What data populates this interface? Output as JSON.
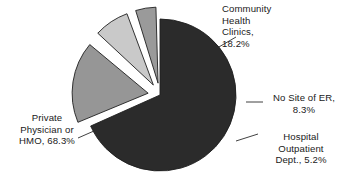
{
  "chart_data": {
    "type": "pie",
    "title": "",
    "xlabel": "",
    "ylabel": "",
    "legend_position": "none",
    "grid": false,
    "start_angle_deg": 0,
    "direction": "clockwise",
    "units": "percent",
    "total": 100.0,
    "categories": [
      "Private Physician or HMO",
      "Community Health Clinics",
      "No Site of ER",
      "Hospital Outpatient Dept."
    ],
    "values": [
      68.3,
      18.2,
      8.3,
      5.2
    ],
    "colors": [
      "#2b2b2b",
      "#969696",
      "#c9c9c9",
      "#9a9a9a"
    ],
    "exploded": [
      false,
      true,
      true,
      true
    ],
    "slices": [
      {
        "name": "Private Physician or HMO",
        "value": 68.3,
        "value_text": "68.3%",
        "label_lines": [
          "Private",
          "Physician or",
          "HMO, 68.3%"
        ],
        "color": "#2b2b2b",
        "exploded": false,
        "angle_deg": 245.9
      },
      {
        "name": "Community Health Clinics",
        "value": 18.2,
        "value_text": "18.2%",
        "label_lines": [
          "Community",
          "Health",
          "Clinics,",
          "18.2%"
        ],
        "color": "#969696",
        "exploded": true,
        "angle_deg": 65.5
      },
      {
        "name": "No Site of ER",
        "value": 8.3,
        "value_text": "8.3%",
        "label_lines": [
          "No Site of ER,",
          "8.3%"
        ],
        "color": "#c9c9c9",
        "exploded": true,
        "angle_deg": 29.9
      },
      {
        "name": "Hospital Outpatient Dept.",
        "value": 5.2,
        "value_text": "5.2%",
        "label_lines": [
          "Hospital",
          "Outpatient",
          "Dept., 5.2%"
        ],
        "color": "#9a9a9a",
        "exploded": true,
        "angle_deg": 18.7
      }
    ]
  },
  "labels": {
    "private": {
      "line1": "Private",
      "line2": "Physician or",
      "line3": "HMO, 68.3%"
    },
    "community": {
      "line1": "Community",
      "line2": "Health",
      "line3": "Clinics,",
      "line4": "18.2%"
    },
    "nosite": {
      "line1": "No Site of ER,",
      "line2": "8.3%"
    },
    "hospital": {
      "line1": "Hospital",
      "line2": "Outpatient",
      "line3": "Dept., 5.2%"
    }
  }
}
